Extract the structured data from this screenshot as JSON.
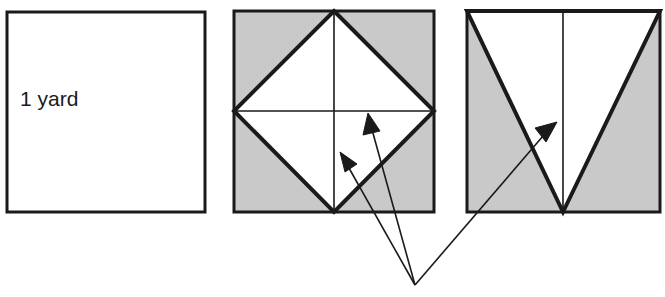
{
  "figure": {
    "background_color": "#ffffff",
    "stroke_color": "#1a1a1a",
    "shade_color": "#c9c9c9",
    "fill_white": "#ffffff"
  },
  "panels": [
    {
      "id": "panel-1",
      "name": "unit-square-panel",
      "label": "1 yard",
      "label_x": 20,
      "label_y": 106,
      "square": {
        "x": 7,
        "y": 12,
        "width": 198,
        "height": 200
      },
      "fill": "#ffffff",
      "border_width": 3
    },
    {
      "id": "panel-2",
      "name": "inscribed-diamond-panel",
      "label": "",
      "square": {
        "x": 234,
        "y": 11,
        "width": 200,
        "height": 201
      },
      "fill": "#c9c9c9",
      "border_width": 3,
      "diamond_points": "334,11 434,111 334,212 234,111",
      "diamond_fill": "#ffffff",
      "diamond_stroke_width": 4,
      "center_vertical": {
        "x1": 334,
        "y1": 11,
        "x2": 334,
        "y2": 212
      },
      "center_horizontal": {
        "x1": 234,
        "y1": 111,
        "x2": 434,
        "y2": 111
      },
      "center_line_width": 1.6
    },
    {
      "id": "panel-3",
      "name": "inverted-triangle-panel",
      "label": "",
      "square": {
        "x": 467,
        "y": 11,
        "width": 193,
        "height": 201
      },
      "fill": "#c9c9c9",
      "border_width": 3,
      "triangle_points": "467,11 660,11 563,212",
      "triangle_fill": "#ffffff",
      "triangle_stroke_width": 4,
      "center_vertical": {
        "x1": 563,
        "y1": 11,
        "x2": 563,
        "y2": 212
      },
      "center_line_width": 1.6
    }
  ],
  "annotation": {
    "name": "converging-pointer-arrows",
    "origin": {
      "x": 415,
      "y": 285
    },
    "line_width": 1.6,
    "arrow_color": "#1a1a1a",
    "arrows": [
      {
        "id": "arrow-1",
        "name": "arrow-to-lower-left-triangle",
        "target_figure": "panel-2",
        "tip": {
          "x": 340,
          "y": 152
        },
        "tail": {
          "x": 415,
          "y": 285
        }
      },
      {
        "id": "arrow-2",
        "name": "arrow-to-lower-right-triangle",
        "target_figure": "panel-2",
        "tip": {
          "x": 368,
          "y": 113
        },
        "tail": {
          "x": 415,
          "y": 285
        }
      },
      {
        "id": "arrow-3",
        "name": "arrow-to-inverted-triangle",
        "target_figure": "panel-3",
        "tip": {
          "x": 557,
          "y": 122
        },
        "tail": {
          "x": 415,
          "y": 285
        }
      }
    ]
  }
}
